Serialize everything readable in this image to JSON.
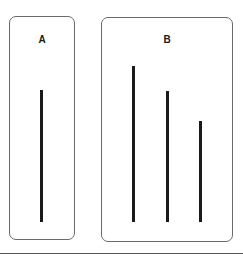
{
  "diagram": {
    "cards": [
      {
        "label": "A",
        "role": "reference line"
      },
      {
        "label": "B",
        "role": "comparison lines"
      }
    ],
    "reference_line": {
      "length_px": 132
    },
    "comparison_lines": [
      {
        "index": 1,
        "length_px": 156
      },
      {
        "index": 2,
        "length_px": 131
      },
      {
        "index": 3,
        "length_px": 101
      }
    ],
    "colors": {
      "line": "#1a1a1a",
      "border": "#6a6a6a",
      "background": "#ffffff"
    }
  }
}
